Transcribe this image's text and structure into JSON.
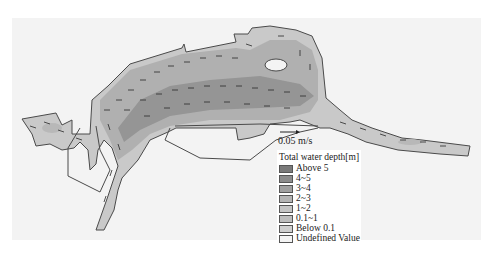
{
  "figure": {
    "type": "depth-averaged velocity field over total water depth map",
    "scale_arrow": {
      "label": "0.05 m/s"
    }
  },
  "legend": {
    "title": "Total water depth[m]",
    "items": [
      {
        "label": "Above 5",
        "color": "#7a7a7a"
      },
      {
        "label": "4~5",
        "color": "#8c8c8c"
      },
      {
        "label": "3~4",
        "color": "#a0a0a0"
      },
      {
        "label": "2~3",
        "color": "#b4b4b4"
      },
      {
        "label": "1~2",
        "color": "#c4c4c4"
      },
      {
        "label": "0.1~1",
        "color": "#bdbdbd"
      },
      {
        "label": "Below 0.1",
        "color": "#cfcfcf"
      },
      {
        "label": "Undefined Value",
        "color": "#f4f4f4"
      }
    ]
  },
  "colors": {
    "background": "#ffffff",
    "panel": "#f3f3f3",
    "outline": "#4a4a4a",
    "arrows": "#2a2a2a"
  }
}
